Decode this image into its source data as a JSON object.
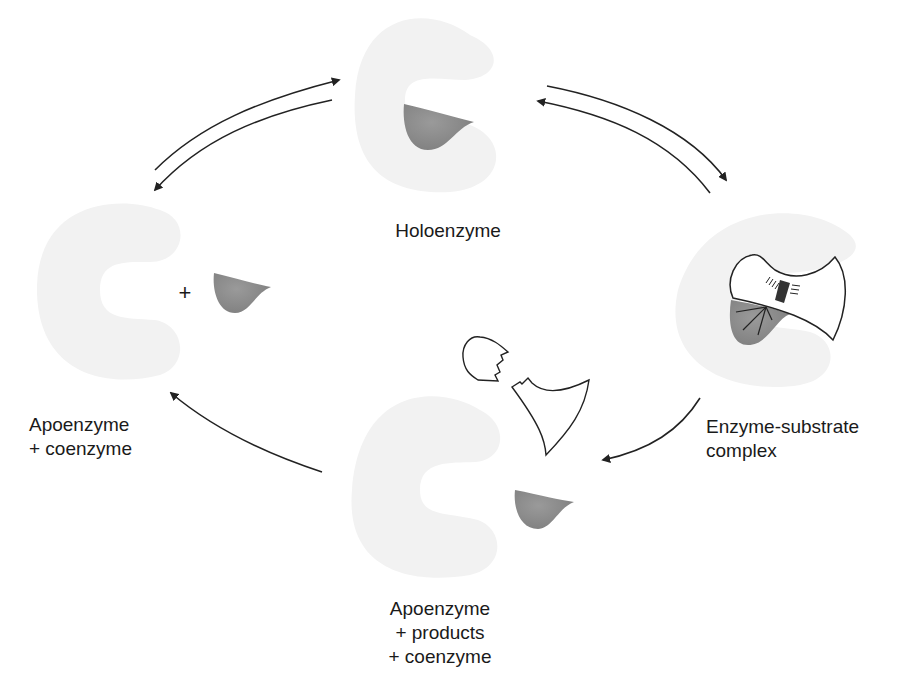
{
  "diagram": {
    "nodes": [
      {
        "id": "holoenzyme",
        "label_lines": [
          "Holoenzyme"
        ]
      },
      {
        "id": "enzyme_substrate",
        "label_lines": [
          "Enzyme-substrate",
          "complex"
        ]
      },
      {
        "id": "apo_products",
        "label_lines": [
          "Apoenzyme",
          "+ products",
          "+ coenzyme"
        ]
      },
      {
        "id": "apo_coenzyme",
        "label_lines": [
          "Apoenzyme",
          "+ coenzyme"
        ]
      }
    ],
    "plus_sign": "+",
    "edges": [
      {
        "from": "apo_coenzyme",
        "to": "holoenzyme",
        "reversible": true
      },
      {
        "from": "holoenzyme",
        "to": "enzyme_substrate",
        "reversible": true
      },
      {
        "from": "enzyme_substrate",
        "to": "apo_products",
        "reversible": false
      },
      {
        "from": "apo_products",
        "to": "apo_coenzyme",
        "reversible": false
      }
    ],
    "colors": {
      "apoenzyme_fill": "#f2f2f2",
      "coenzyme_fill": "#8c8c8c",
      "outline": "#222222",
      "arrow": "#222222"
    }
  }
}
